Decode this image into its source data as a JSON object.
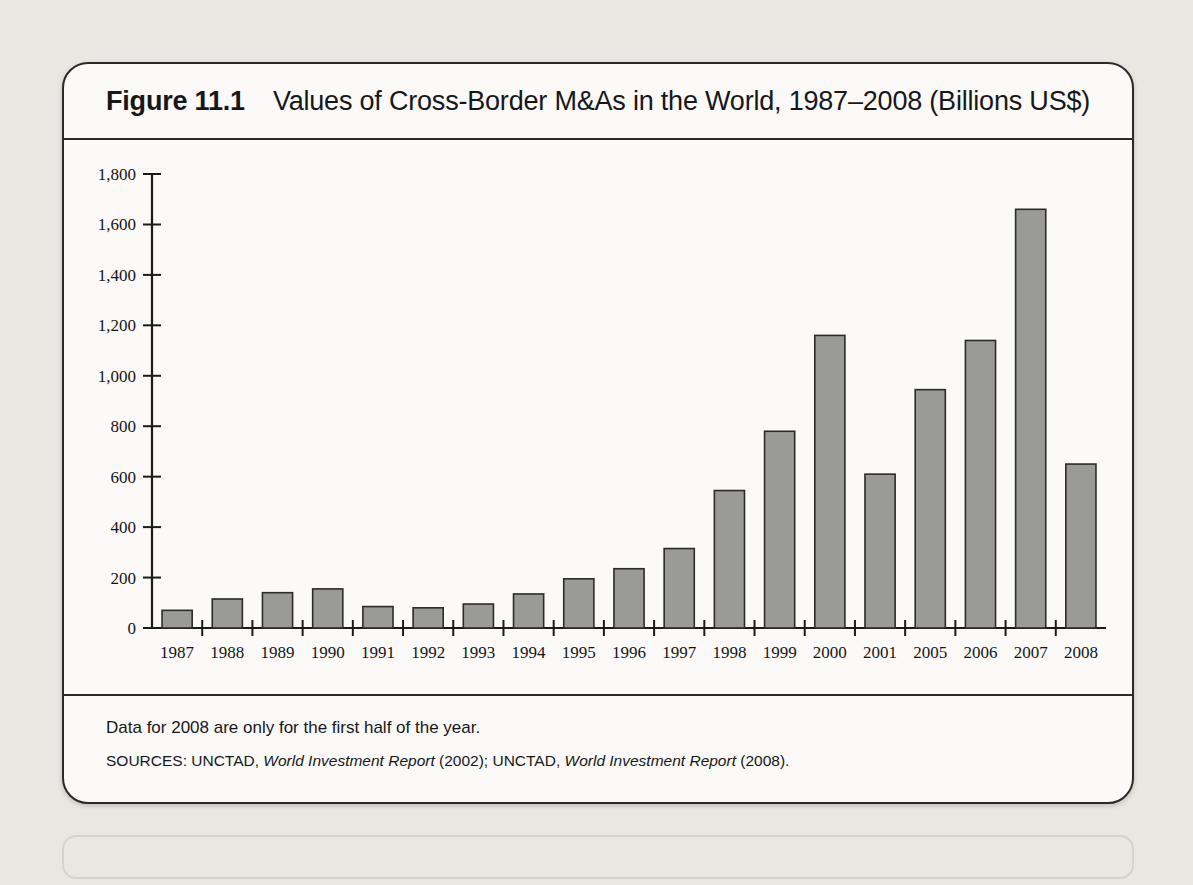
{
  "figure": {
    "number": "Figure 11.1",
    "title": "Values of Cross-Border M&As in the World, 1987–2008 (Billions US$)",
    "note": "Data for 2008 are only for the first half of the year.",
    "sources_prefix": "SOURCES: UNCTAD, ",
    "sources_italic_1": "World Investment Report",
    "sources_mid": " (2002); UNCTAD, ",
    "sources_italic_2": "World Investment Report",
    "sources_suffix": " (2008)."
  },
  "colors": {
    "bar_fill": "#9a9a98",
    "bar_stroke": "#2b2b2b",
    "panel_bg": "#fbfaf8",
    "page_bg": "#e9e7e2",
    "ink": "#17171a"
  },
  "chart_data": {
    "type": "bar",
    "title": "Values of Cross-Border M&As in the World, 1987–2008 (Billions US$)",
    "xlabel": "",
    "ylabel": "",
    "ylim": [
      0,
      1800
    ],
    "ytick_values": [
      0,
      200,
      400,
      600,
      800,
      1000,
      1200,
      1400,
      1600,
      1800
    ],
    "ytick_labels": [
      "0",
      "200",
      "400",
      "600",
      "800",
      "1,000",
      "1,200",
      "1,400",
      "1,600",
      "1,800"
    ],
    "grid": false,
    "legend": "none",
    "units": "Billions US$",
    "categories": [
      "1987",
      "1988",
      "1989",
      "1990",
      "1991",
      "1992",
      "1993",
      "1994",
      "1995",
      "1996",
      "1997",
      "1998",
      "1999",
      "2000",
      "2001",
      "2005",
      "2006",
      "2007",
      "2008"
    ],
    "values": [
      70,
      115,
      140,
      155,
      85,
      80,
      95,
      135,
      195,
      235,
      315,
      545,
      780,
      1160,
      610,
      945,
      1140,
      1660,
      650
    ],
    "notes": [
      "Years 2002–2004 are not shown.",
      "Data for 2008 are only for the first half of the year."
    ]
  },
  "bleed_text": [
    {
      "x": 150,
      "y": 70,
      "t": "llegal immigration is considered by many as a problem determined on a country-by-coun"
    },
    {
      "x": 100,
      "y": 100,
      "t": "basis, which is an incorrect approach. The illegal migration movement should be looked at as"
    },
    {
      "x": 100,
      "y": 130,
      "t": "part of the global flow of the resources around the world. It can be simply put as the outcom"
    },
    {
      "x": 100,
      "y": 160,
      "t": "of transnationalization of the production and distribution process for goods and services and t"
    },
    {
      "x": 100,
      "y": 196,
      "t": "movement of employment opportunities that exist in foreign countries."
    },
    {
      "x": 130,
      "y": 236,
      "t": "Official figures on the inflow of migrants into the Organization for Economic Cooperati"
    },
    {
      "x": 100,
      "y": 266,
      "t": "Development (OECD) countries (OECD, 2000) do not seem to show any significant increase in inte"
    },
    {
      "x": 100,
      "y": 296,
      "t": "migration  as a result of the trend of globalization. Instead, variation in the size of legal immigrat"
    },
    {
      "x": 100,
      "y": 326,
      "t": "and to a lesser extent on exogenous events involving political actions such as the Korean war,"
    },
    {
      "x": 100,
      "y": 356,
      "t": "shores of the Soviet Union, the war in Vietnam and so forth. It also has to do with the attitude of im"
    },
    {
      "x": 100,
      "y": 386,
      "t": "federal countries should supervision. As to to illegal immigration into the OECD countries it is all"
    },
    {
      "x": 100,
      "y": 416,
      "t": "less difficult to measure, indications assess whether there has been an upward trend."
    },
    {
      "x": 560,
      "y": 492,
      "t": "NOITALUPOP DNA ROBAL 11"
    },
    {
      "x": 600,
      "y": 556,
      "t": "noitargiM ruobaL 1.11"
    },
    {
      "x": 100,
      "y": 666,
      "t": "Although a large share of the economic growth in the Asian region is accounted for by"
    },
    {
      "x": 100,
      "y": 696,
      "t": "of trade, trade in the Asian region has become increasingly important for most of the coun"
    },
    {
      "x": 100,
      "y": 726,
      "t": "ties than has the overall volume of trade; see Table 11.1, which provides a detailed breakdown at"
    },
    {
      "x": 100,
      "y": 756,
      "t": "individual Asian countries' share of exports to the Asian region from 1985 to 1998."
    }
  ]
}
